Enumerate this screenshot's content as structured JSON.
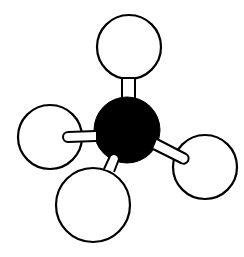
{
  "diagram": {
    "type": "ball-and-stick molecular model",
    "background": "#ffffff",
    "line_color": "#000000",
    "central_atom": {
      "element": "C",
      "fill": "#000000",
      "cx": 127,
      "cy": 130,
      "r": 33
    },
    "hydrogens": [
      {
        "id": "top",
        "element": "H",
        "fill": "#ffffff",
        "cx": 129,
        "cy": 47,
        "r": 32
      },
      {
        "id": "left",
        "element": "H",
        "fill": "#ffffff",
        "cx": 50,
        "cy": 137,
        "r": 32
      },
      {
        "id": "bottom",
        "element": "H",
        "fill": "#ffffff",
        "cx": 93,
        "cy": 205,
        "r": 37
      },
      {
        "id": "right",
        "element": "H",
        "fill": "#ffffff",
        "cx": 205,
        "cy": 167,
        "r": 32
      }
    ],
    "bonds": [
      {
        "id": "top",
        "from": "C",
        "to": "H-top"
      },
      {
        "id": "left",
        "from": "C",
        "to": "H-left"
      },
      {
        "id": "bottom",
        "from": "C",
        "to": "H-bottom"
      },
      {
        "id": "right",
        "from": "C",
        "to": "H-right"
      }
    ]
  }
}
